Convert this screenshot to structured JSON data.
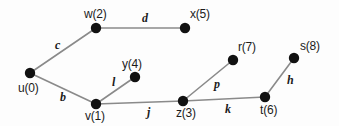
{
  "diagram": {
    "background_color": "#fdfdfd",
    "node_color": "#111111",
    "edge_color": "#8a8a8a",
    "text_color": "#1b1b1b",
    "node_radius": 5.2
  },
  "nodes": [
    {
      "id": "u",
      "label": "u(0)",
      "x": 30,
      "y": 73,
      "label_x": 18,
      "label_y": 82,
      "label_anchor": "start"
    },
    {
      "id": "w",
      "label": "w(2)",
      "x": 96,
      "y": 28,
      "label_x": 84,
      "label_y": 8,
      "label_anchor": "start"
    },
    {
      "id": "x",
      "label": "x(5)",
      "x": 185,
      "y": 28,
      "label_x": 190,
      "label_y": 8,
      "label_anchor": "start"
    },
    {
      "id": "y",
      "label": "y(4)",
      "x": 135,
      "y": 77,
      "label_x": 122,
      "label_y": 58,
      "label_anchor": "start"
    },
    {
      "id": "v",
      "label": "v(1)",
      "x": 96,
      "y": 104,
      "label_x": 85,
      "label_y": 110,
      "label_anchor": "start"
    },
    {
      "id": "z",
      "label": "z(3)",
      "x": 183,
      "y": 101,
      "label_x": 176,
      "label_y": 107,
      "label_anchor": "start"
    },
    {
      "id": "r",
      "label": "r(7)",
      "x": 233,
      "y": 60,
      "label_x": 238,
      "label_y": 41,
      "label_anchor": "start"
    },
    {
      "id": "t",
      "label": "t(6)",
      "x": 265,
      "y": 97,
      "label_x": 260,
      "label_y": 104,
      "label_anchor": "start"
    },
    {
      "id": "s",
      "label": "s(8)",
      "x": 294,
      "y": 58,
      "label_x": 300,
      "label_y": 40,
      "label_anchor": "start"
    }
  ],
  "edges": [
    {
      "id": "c",
      "label": "c",
      "from": "u",
      "to": "w",
      "label_x": 55,
      "label_y": 39
    },
    {
      "id": "d",
      "label": "d",
      "from": "w",
      "to": "x",
      "label_x": 142,
      "label_y": 12
    },
    {
      "id": "b",
      "label": "b",
      "from": "u",
      "to": "v",
      "label_x": 60,
      "label_y": 91
    },
    {
      "id": "l",
      "label": "l",
      "from": "v",
      "to": "y",
      "label_x": 112,
      "label_y": 76
    },
    {
      "id": "j",
      "label": "j",
      "from": "v",
      "to": "z",
      "label_x": 147,
      "label_y": 106
    },
    {
      "id": "p",
      "label": "p",
      "from": "z",
      "to": "r",
      "label_x": 214,
      "label_y": 78
    },
    {
      "id": "k",
      "label": "k",
      "from": "z",
      "to": "t",
      "label_x": 225,
      "label_y": 103
    },
    {
      "id": "h",
      "label": "h",
      "from": "t",
      "to": "s",
      "label_x": 287,
      "label_y": 74
    }
  ]
}
